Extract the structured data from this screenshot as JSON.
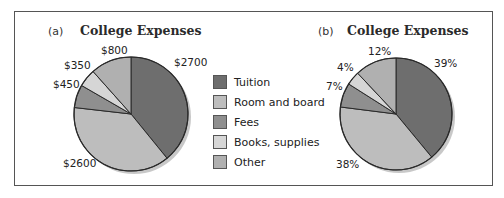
{
  "chart_data": [
    {
      "type": "pie",
      "panel": "(a)",
      "title": "College Expenses",
      "categories": [
        "Tuition",
        "Room and board",
        "Fees",
        "Books, supplies",
        "Other"
      ],
      "values": [
        2700,
        2600,
        450,
        350,
        800
      ],
      "labels": [
        "$2700",
        "$2600",
        "$450",
        "$350",
        "$800"
      ],
      "units": "dollars"
    },
    {
      "type": "pie",
      "panel": "(b)",
      "title": "College Expenses",
      "categories": [
        "Tuition",
        "Room and board",
        "Fees",
        "Books, supplies",
        "Other"
      ],
      "values": [
        39,
        38,
        7,
        4,
        12
      ],
      "labels": [
        "39%",
        "38%",
        "7%",
        "4%",
        "12%"
      ],
      "units": "percent"
    }
  ],
  "panels": {
    "a": {
      "label": "(a)",
      "title": "College Expenses",
      "slice_labels": {
        "tuition": "$2700",
        "room": "$2600",
        "fees": "$450",
        "books": "$350",
        "other": "$800"
      }
    },
    "b": {
      "label": "(b)",
      "title": "College Expenses",
      "slice_labels": {
        "tuition": "39%",
        "room": "38%",
        "fees": "7%",
        "books": "4%",
        "other": "12%"
      }
    }
  },
  "legend": {
    "items": [
      {
        "label": "Tuition",
        "color": "#6e6e6e"
      },
      {
        "label": "Room and board",
        "color": "#bdbdbd"
      },
      {
        "label": "Fees",
        "color": "#8f8f8f"
      },
      {
        "label": "Books, supplies",
        "color": "#d6d6d6"
      },
      {
        "label": "Other",
        "color": "#b0b0b0"
      }
    ]
  }
}
